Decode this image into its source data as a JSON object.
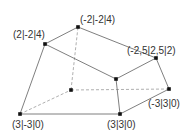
{
  "diagram": {
    "type": "3d-polyhedron-oblique-projection",
    "colors": {
      "background": "#ffffff",
      "edge_solid": "#707070",
      "edge_dashed": "#9a9a9a",
      "vertex": "#111111",
      "label": "#333333"
    },
    "vertices": [
      {
        "id": "A",
        "label": "(3|-3|0)",
        "x": 20,
        "y": 114,
        "label_x": 12,
        "label_y": 128
      },
      {
        "id": "B",
        "label": "(3|3|0)",
        "x": 120,
        "y": 114,
        "label_x": 107,
        "label_y": 128
      },
      {
        "id": "C",
        "label": "(-3|3|0)",
        "x": 169,
        "y": 89,
        "label_x": 148,
        "label_y": 107
      },
      {
        "id": "D",
        "label": "",
        "x": 71,
        "y": 90,
        "label_x": 0,
        "label_y": 0
      },
      {
        "id": "E",
        "label": "(2|-2|4)",
        "x": 45,
        "y": 44,
        "label_x": 13,
        "label_y": 38
      },
      {
        "id": "F",
        "label": "(-2|-2|4)",
        "x": 78,
        "y": 27,
        "label_x": 80,
        "label_y": 23
      },
      {
        "id": "G",
        "label": "(-2,5|2,5|2)",
        "x": 156,
        "y": 58,
        "label_x": 127,
        "label_y": 54
      },
      {
        "id": "H",
        "label": "",
        "x": 116,
        "y": 79,
        "label_x": 0,
        "label_y": 0
      }
    ],
    "solid_edges": [
      [
        "A",
        "B"
      ],
      [
        "B",
        "C"
      ],
      [
        "A",
        "E"
      ],
      [
        "E",
        "F"
      ],
      [
        "F",
        "G"
      ],
      [
        "E",
        "H"
      ],
      [
        "H",
        "G"
      ],
      [
        "G",
        "C"
      ],
      [
        "H",
        "B"
      ]
    ],
    "dashed_edges": [
      [
        "A",
        "D"
      ],
      [
        "D",
        "C"
      ],
      [
        "D",
        "F"
      ]
    ]
  }
}
